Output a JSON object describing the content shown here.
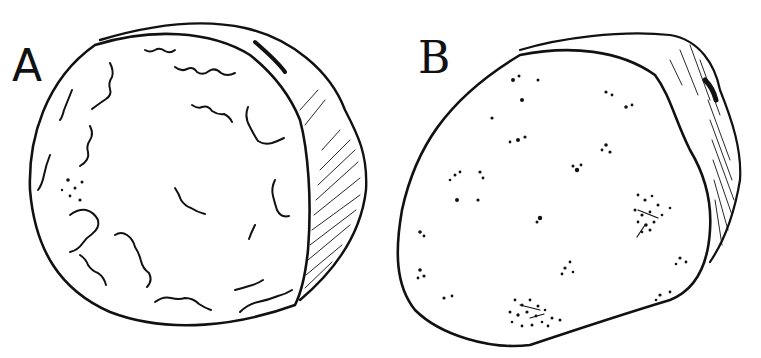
{
  "figures": [
    {
      "id": "A",
      "label": "A",
      "description": "cut cross-section showing squiggly vein-like markings, shaded rind on right side"
    },
    {
      "id": "B",
      "label": "B",
      "description": "cut cross-section showing scattered speckled spots, shaded rind on upper right"
    }
  ],
  "colors": {
    "ink": "#111111",
    "paper": "#ffffff"
  }
}
